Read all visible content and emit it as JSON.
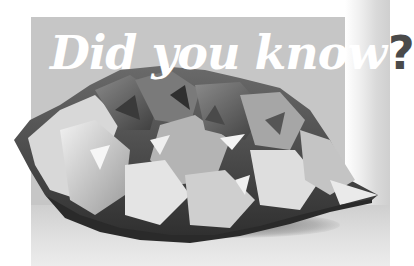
{
  "image": {
    "description": "Grayscale photo of an amethyst/quartz crystal geode cluster on a light surface, with a gray title panel behind it",
    "colors": {
      "panel": "#c6c6c6",
      "background": "#ffffff",
      "title_text": "#ffffff",
      "question_mark": "#4a4a4a"
    }
  },
  "headline": {
    "text": "Did you know",
    "punctuation": "?"
  }
}
